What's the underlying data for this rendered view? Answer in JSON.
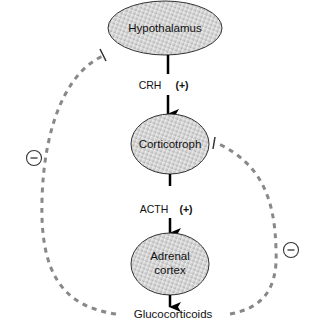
{
  "diagram": {
    "type": "hormone feedback loop",
    "nodes": [
      {
        "id": "hypothalamus",
        "label": "Hypothalamus"
      },
      {
        "id": "corticotroph",
        "label": "Corticotroph"
      },
      {
        "id": "adrenal",
        "label_line1": "Adrenal",
        "label_line2": "cortex"
      },
      {
        "id": "glucocorticoids",
        "label": "Glucocorticoids"
      }
    ],
    "edges": [
      {
        "from": "hypothalamus",
        "to": "corticotroph",
        "hormone": "CRH",
        "effect": "(+)"
      },
      {
        "from": "corticotroph",
        "to": "adrenal",
        "hormone": "ACTH",
        "effect": "(+)"
      },
      {
        "from": "adrenal",
        "to": "glucocorticoids"
      }
    ],
    "feedback": [
      {
        "from": "glucocorticoids",
        "to": "hypothalamus",
        "effect": "−",
        "style": "dashed-inhibition"
      },
      {
        "from": "glucocorticoids",
        "to": "corticotroph",
        "effect": "−",
        "style": "dashed-inhibition"
      }
    ],
    "colors": {
      "ellipse_fill_light": "#f2f2f2",
      "ellipse_fill_dark": "#b8b8b8",
      "ellipse_stroke": "#333333",
      "arrow": "#000000",
      "dashed_feedback": "#888888"
    }
  }
}
